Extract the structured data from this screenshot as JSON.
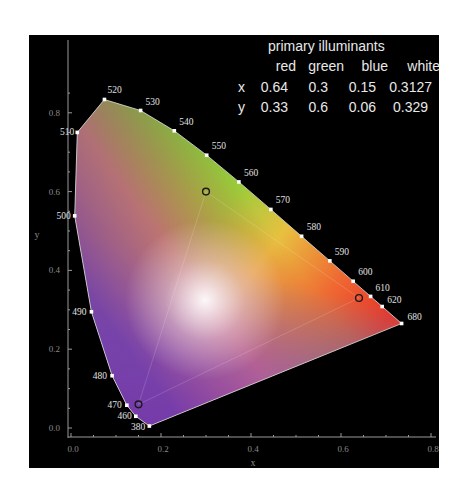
{
  "chart_data": {
    "type": "scatter",
    "xlabel": "x",
    "ylabel": "y",
    "xlim": [
      0.0,
      0.8
    ],
    "ylim": [
      0.0,
      0.85
    ],
    "x_ticks": [
      "0.0",
      "0.2",
      "0.4",
      "0.6",
      "0.8"
    ],
    "y_ticks": [
      "0.0",
      "0.2",
      "0.4",
      "0.6",
      "0.8"
    ],
    "grid": false,
    "spectral_locus": [
      {
        "nm": "380",
        "x": 0.1741,
        "y": 0.005
      },
      {
        "nm": "460",
        "x": 0.144,
        "y": 0.0297
      },
      {
        "nm": "470",
        "x": 0.1241,
        "y": 0.0578
      },
      {
        "nm": "480",
        "x": 0.0913,
        "y": 0.1327
      },
      {
        "nm": "490",
        "x": 0.0454,
        "y": 0.295
      },
      {
        "nm": "500",
        "x": 0.0082,
        "y": 0.5384
      },
      {
        "nm": "510",
        "x": 0.0139,
        "y": 0.7502
      },
      {
        "nm": "520",
        "x": 0.0743,
        "y": 0.8338
      },
      {
        "nm": "530",
        "x": 0.1547,
        "y": 0.8059
      },
      {
        "nm": "540",
        "x": 0.2296,
        "y": 0.7543
      },
      {
        "nm": "550",
        "x": 0.3016,
        "y": 0.6923
      },
      {
        "nm": "560",
        "x": 0.3731,
        "y": 0.6245
      },
      {
        "nm": "570",
        "x": 0.4441,
        "y": 0.5547
      },
      {
        "nm": "580",
        "x": 0.5125,
        "y": 0.4866
      },
      {
        "nm": "590",
        "x": 0.5752,
        "y": 0.4242
      },
      {
        "nm": "600",
        "x": 0.627,
        "y": 0.3725
      },
      {
        "nm": "610",
        "x": 0.6658,
        "y": 0.334
      },
      {
        "nm": "620",
        "x": 0.6915,
        "y": 0.3083
      },
      {
        "nm": "680",
        "x": 0.7347,
        "y": 0.2653
      }
    ],
    "primaries": [
      {
        "name": "red",
        "x": 0.64,
        "y": 0.33
      },
      {
        "name": "green",
        "x": 0.3,
        "y": 0.6
      },
      {
        "name": "blue",
        "x": 0.15,
        "y": 0.06
      }
    ],
    "white_point": {
      "name": "white",
      "x": 0.3127,
      "y": 0.329
    }
  },
  "table": {
    "title": "primary illuminants",
    "headers": [
      "",
      "red",
      "green",
      "blue",
      "white"
    ],
    "rows": [
      [
        "x",
        "0.64",
        "0.3",
        "0.15",
        "0.3127"
      ],
      [
        "y",
        "0.33",
        "0.6",
        "0.06",
        "0.329"
      ]
    ]
  },
  "colors": {
    "background": "#000000",
    "axis": "#9a9a9a",
    "label_text": "#e0e0e0"
  }
}
